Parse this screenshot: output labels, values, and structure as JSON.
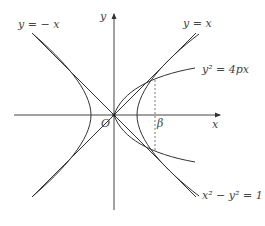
{
  "figure": {
    "axes": {
      "x_label": "x",
      "y_label": "y",
      "origin_label": "O"
    },
    "curves": {
      "asymptote_pos_label": "y = x",
      "asymptote_neg_label": "y = − x",
      "parabola_label": "y² = 4px",
      "hyperbola_label": "x² − y² = 1"
    },
    "markers": {
      "intersection_x_label": "β"
    },
    "colors": {
      "stroke": "#333333",
      "text": "#444444",
      "background": "#ffffff"
    }
  }
}
